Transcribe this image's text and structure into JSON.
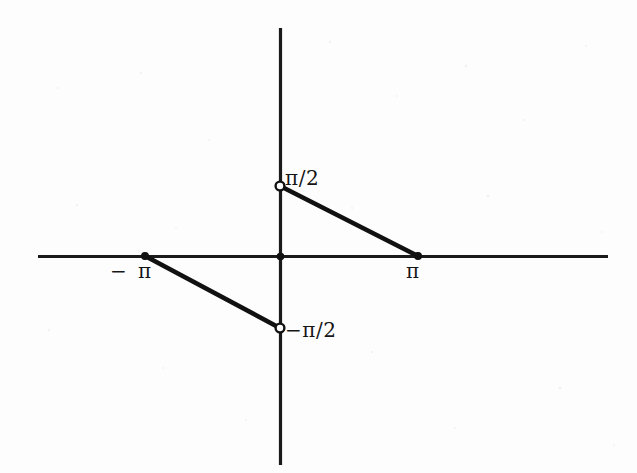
{
  "figure": {
    "background_color": "#fdfdfd",
    "ink_color": "#111111",
    "width": 637,
    "height": 473
  },
  "labels": {
    "pi_over_2": "π/2",
    "neg_pi_over_2": "−π/2",
    "neg_pi": "− π",
    "pi": "π"
  },
  "chart_data": {
    "type": "line",
    "title": "",
    "subtitle": "",
    "xlabel": "",
    "ylabel": "",
    "grid": false,
    "legend": null,
    "axes": {
      "x_axis": {
        "y_pixel": 256,
        "x_start_pixel": 38,
        "x_end_pixel": 608,
        "arrows": false
      },
      "y_axis": {
        "x_pixel": 280,
        "y_start_pixel": 28,
        "y_end_pixel": 465,
        "arrows": false
      },
      "origin_pixel": [
        280,
        256
      ],
      "x_tick_labels": [
        "−π",
        "π"
      ],
      "x_tick_values": [
        -3.14159,
        3.14159
      ],
      "y_tick_labels": [
        "π/2",
        "−π/2"
      ],
      "y_tick_values": [
        1.5708,
        -1.5708
      ],
      "xlim": [
        -4.55,
        5.05
      ],
      "ylim": [
        -5.2,
        3.25
      ]
    },
    "series": [
      {
        "name": "segment-left",
        "points": [
          {
            "x": -3.14159,
            "y": 0,
            "endpoint": "closed",
            "pixel": [
              145,
              256
            ]
          },
          {
            "x": 0,
            "y": -1.5708,
            "endpoint": "open",
            "pixel": [
              280,
              328
            ]
          }
        ]
      },
      {
        "name": "segment-right",
        "points": [
          {
            "x": 0,
            "y": 1.5708,
            "endpoint": "open",
            "pixel": [
              280,
              186
            ]
          },
          {
            "x": 3.14159,
            "y": 0,
            "endpoint": "closed",
            "pixel": [
              418,
              256
            ]
          }
        ]
      }
    ],
    "markers": [
      {
        "kind": "open-circle",
        "label": "π/2",
        "pixel": [
          280,
          186
        ]
      },
      {
        "kind": "open-circle",
        "label": "−π/2",
        "pixel": [
          280,
          328
        ]
      },
      {
        "kind": "closed-dot",
        "label": "−π",
        "pixel": [
          145,
          256
        ]
      },
      {
        "kind": "closed-dot",
        "label": "π",
        "pixel": [
          418,
          256
        ]
      },
      {
        "kind": "closed-dot",
        "label": "origin",
        "pixel": [
          280,
          256
        ]
      }
    ]
  }
}
